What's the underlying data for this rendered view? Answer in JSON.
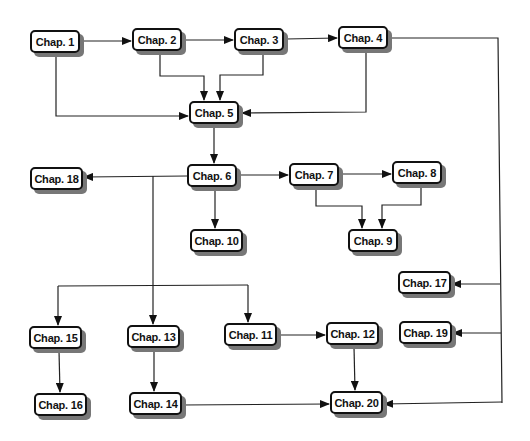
{
  "diagram": {
    "title": "",
    "nodes": [
      {
        "id": "ch1",
        "label": "Chap. 1",
        "x": 30,
        "y": 30
      },
      {
        "id": "ch2",
        "label": "Chap. 2",
        "x": 132,
        "y": 28
      },
      {
        "id": "ch3",
        "label": "Chap. 3",
        "x": 234,
        "y": 28
      },
      {
        "id": "ch4",
        "label": "Chap. 4",
        "x": 338,
        "y": 26
      },
      {
        "id": "ch5",
        "label": "Chap. 5",
        "x": 189,
        "y": 101
      },
      {
        "id": "ch6",
        "label": "Chap. 6",
        "x": 187,
        "y": 164
      },
      {
        "id": "ch7",
        "label": "Chap. 7",
        "x": 289,
        "y": 163
      },
      {
        "id": "ch8",
        "label": "Chap. 8",
        "x": 392,
        "y": 161
      },
      {
        "id": "ch9",
        "label": "Chap. 9",
        "x": 348,
        "y": 229
      },
      {
        "id": "ch10",
        "label": "Chap. 10",
        "x": 190,
        "y": 229
      },
      {
        "id": "ch11",
        "label": "Chap. 11",
        "x": 224,
        "y": 323
      },
      {
        "id": "ch12",
        "label": "Chap. 12",
        "x": 326,
        "y": 322
      },
      {
        "id": "ch13",
        "label": "Chap. 13",
        "x": 127,
        "y": 325
      },
      {
        "id": "ch14",
        "label": "Chap. 14",
        "x": 129,
        "y": 392
      },
      {
        "id": "ch15",
        "label": "Chap. 15",
        "x": 29,
        "y": 326
      },
      {
        "id": "ch16",
        "label": "Chap. 16",
        "x": 34,
        "y": 393
      },
      {
        "id": "ch17",
        "label": "Chap. 17",
        "x": 398,
        "y": 271
      },
      {
        "id": "ch18",
        "label": "Chap. 18",
        "x": 30,
        "y": 167
      },
      {
        "id": "ch19",
        "label": "Chap. 19",
        "x": 399,
        "y": 321
      },
      {
        "id": "ch20",
        "label": "Chap. 20",
        "x": 330,
        "y": 391
      }
    ],
    "edges": [
      {
        "from": "Chap. 1",
        "to": "Chap. 2"
      },
      {
        "from": "Chap. 2",
        "to": "Chap. 3"
      },
      {
        "from": "Chap. 3",
        "to": "Chap. 4"
      },
      {
        "from": "Chap. 1",
        "to": "Chap. 5"
      },
      {
        "from": "Chap. 2",
        "to": "Chap. 5"
      },
      {
        "from": "Chap. 3",
        "to": "Chap. 5"
      },
      {
        "from": "Chap. 4",
        "to": "Chap. 5"
      },
      {
        "from": "Chap. 5",
        "to": "Chap. 6"
      },
      {
        "from": "Chap. 6",
        "to": "Chap. 18"
      },
      {
        "from": "Chap. 6",
        "to": "Chap. 7"
      },
      {
        "from": "Chap. 6",
        "to": "Chap. 10"
      },
      {
        "from": "Chap. 7",
        "to": "Chap. 8"
      },
      {
        "from": "Chap. 7",
        "to": "Chap. 9"
      },
      {
        "from": "Chap. 8",
        "to": "Chap. 9"
      },
      {
        "from": "Chap. 6",
        "to": "Chap. 15"
      },
      {
        "from": "Chap. 6",
        "to": "Chap. 13"
      },
      {
        "from": "Chap. 6",
        "to": "Chap. 11"
      },
      {
        "from": "Chap. 15",
        "to": "Chap. 16"
      },
      {
        "from": "Chap. 13",
        "to": "Chap. 14"
      },
      {
        "from": "Chap. 11",
        "to": "Chap. 12"
      },
      {
        "from": "Chap. 12",
        "to": "Chap. 20"
      },
      {
        "from": "Chap. 14",
        "to": "Chap. 20"
      },
      {
        "from": "Chap. 4",
        "to": "Chap. 17"
      },
      {
        "from": "Chap. 4",
        "to": "Chap. 19"
      },
      {
        "from": "Chap. 4",
        "to": "Chap. 20"
      }
    ]
  }
}
